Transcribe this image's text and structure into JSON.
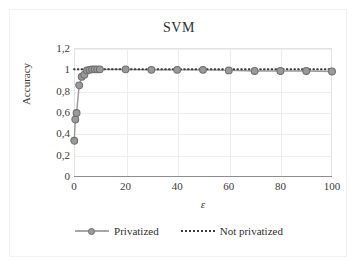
{
  "chart_data": {
    "type": "line",
    "title": "SVM",
    "xlabel": "ε",
    "ylabel": "Accuracy",
    "xlim": [
      0,
      100
    ],
    "ylim": [
      0,
      1.2
    ],
    "grid": true,
    "legend_position": "bottom",
    "x_ticks": [
      "0",
      "20",
      "40",
      "60",
      "80",
      "100"
    ],
    "x_tick_values": [
      0,
      20,
      40,
      60,
      80,
      100
    ],
    "y_ticks": [
      "0",
      "0,2",
      "0,4",
      "0,6",
      "0,8",
      "1",
      "1,2"
    ],
    "y_tick_values": [
      0,
      0.2,
      0.4,
      0.6,
      0.8,
      1.0,
      1.2
    ],
    "decimal_separator": ",",
    "series": [
      {
        "name": "Privatized",
        "style": "solid-with-markers",
        "color": "#9a9a9a",
        "marker_color": "#9a9a9a",
        "marker_edge_color": "#6f6f6f",
        "x": [
          0.1,
          0.5,
          1,
          2,
          3,
          4,
          5,
          6,
          7,
          8,
          9,
          10,
          20,
          30,
          40,
          50,
          60,
          70,
          80,
          90,
          100
        ],
        "y": [
          0.33,
          0.53,
          0.59,
          0.85,
          0.93,
          0.95,
          0.99,
          0.995,
          1.0,
          1.0,
          1.0,
          1.0,
          1.0,
          0.995,
          0.995,
          0.995,
          0.99,
          0.985,
          0.985,
          0.985,
          0.98
        ]
      },
      {
        "name": "Not privatized",
        "style": "dotted",
        "color": "#3a3a3a",
        "x": [
          0,
          100
        ],
        "y": [
          1.0,
          1.0
        ]
      }
    ]
  },
  "legend": {
    "entries": [
      {
        "label": "Privatized"
      },
      {
        "label": "Not privatized"
      }
    ]
  }
}
